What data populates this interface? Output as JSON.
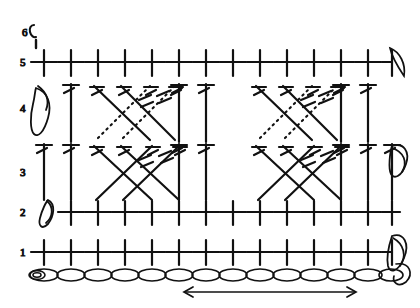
{
  "diagram": {
    "type": "crochet-symbol-chart",
    "ink_color": "#111111",
    "background_color": "#ffffff",
    "direction_note": "double-headed arrow under foundation chain",
    "row_labels": [
      "1",
      "2",
      "3",
      "4",
      "5",
      "6"
    ],
    "columns": 14,
    "foundation": {
      "name": "foundation-chain",
      "chain_count": 14,
      "symbol": "oval-chain-stitch",
      "slip_knot_marker": true
    },
    "arrow": {
      "name": "direction-arrow",
      "style": "double-headed",
      "x1": 185,
      "x2": 355,
      "y": 292
    },
    "rows": [
      {
        "number": "1",
        "label_x": 26,
        "baseline_y": 252,
        "stitch": "single-crochet",
        "symbol": "cross",
        "count": 14,
        "turning_chain": false
      },
      {
        "number": "2",
        "label_x": 26,
        "baseline_y": 212,
        "stitch": "single-crochet",
        "symbol": "cross",
        "count": 13,
        "turning_chain": true
      },
      {
        "number": "3",
        "label_x": 26,
        "baseline_y": 172,
        "stitch": "double-crochet-and-crossed-trebles",
        "symbol": "post-with-hash",
        "count": 14,
        "turning_chain": true
      },
      {
        "number": "4",
        "label_x": 26,
        "baseline_y": 112,
        "stitch": "double-crochet-and-crossed-trebles",
        "symbol": "post-with-hash",
        "count": 14,
        "turning_chain": true
      },
      {
        "number": "5",
        "label_x": 26,
        "baseline_y": 62,
        "stitch": "single-crochet",
        "symbol": "cross",
        "count": 14,
        "turning_chain": true
      },
      {
        "number": "6",
        "label_x": 30,
        "baseline_y": 30,
        "stitch": "turning-chain",
        "symbol": "chain-loop",
        "count": 1,
        "turning_chain": true
      }
    ],
    "cables": [
      {
        "name": "cable-group-left-upper",
        "row": "4",
        "crossing": "front-post-over-back-post",
        "solid_strands": 2,
        "dotted_strands": 2
      },
      {
        "name": "cable-group-right-upper",
        "row": "4",
        "crossing": "front-post-over-back-post",
        "solid_strands": 2,
        "dotted_strands": 2
      },
      {
        "name": "cable-group-left-lower",
        "row": "3",
        "crossing": "crossed-treble",
        "solid_strands": 2,
        "dotted_strands": 0
      },
      {
        "name": "cable-group-right-lower",
        "row": "3",
        "crossing": "crossed-treble",
        "solid_strands": 2,
        "dotted_strands": 0
      }
    ],
    "legend_symbols": [
      {
        "name": "chain-stitch",
        "glyph": "oval"
      },
      {
        "name": "single-crochet",
        "glyph": "cross"
      },
      {
        "name": "double-crochet",
        "glyph": "post-one-hash"
      },
      {
        "name": "treble-crochet",
        "glyph": "post-two-hash"
      },
      {
        "name": "front-post-treble",
        "glyph": "solid-diagonal"
      },
      {
        "name": "back-post-treble",
        "glyph": "dotted-diagonal"
      }
    ]
  }
}
